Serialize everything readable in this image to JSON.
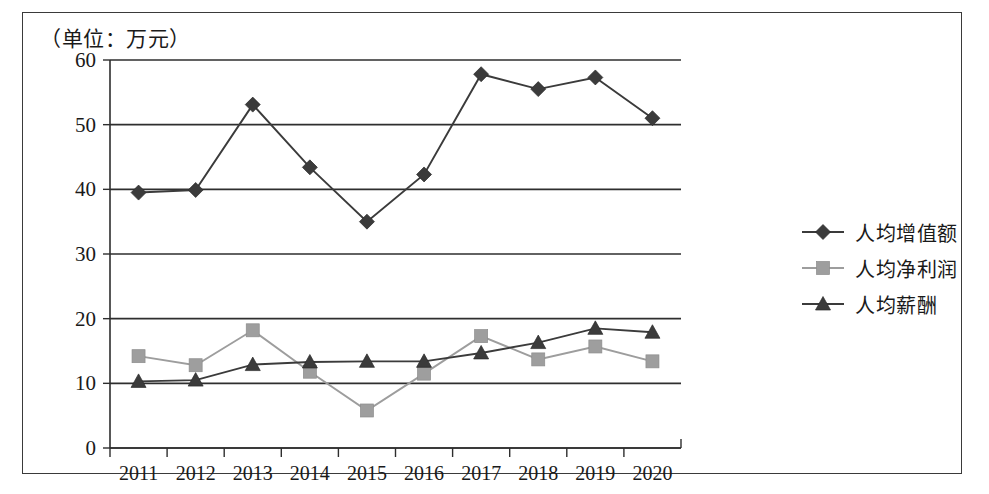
{
  "chart_data": {
    "type": "line",
    "title": "（单位：万元）",
    "xlabel": "",
    "ylabel": "",
    "ylim": [
      0,
      60
    ],
    "ytick_step": 10,
    "yticks": [
      "0",
      "10",
      "20",
      "30",
      "40",
      "50",
      "60"
    ],
    "categories": [
      "2011",
      "2012",
      "2013",
      "2014",
      "2015",
      "2016",
      "2017",
      "2018",
      "2019",
      "2020"
    ],
    "grid": true,
    "legend_position": "right",
    "series": [
      {
        "name": "人均增值额",
        "marker": "diamond",
        "color": "#3b3b3b",
        "values": [
          39.5,
          39.9,
          53.1,
          43.4,
          35.0,
          42.3,
          57.8,
          55.5,
          57.3,
          51.0
        ]
      },
      {
        "name": "人均净利润",
        "marker": "square",
        "color": "#9e9e9e",
        "values": [
          14.2,
          12.8,
          18.2,
          11.8,
          5.8,
          11.5,
          17.3,
          13.7,
          15.7,
          13.4
        ]
      },
      {
        "name": "人均薪酬",
        "marker": "triangle",
        "color": "#3b3b3b",
        "values": [
          10.3,
          10.5,
          12.9,
          13.3,
          13.4,
          13.4,
          14.7,
          16.3,
          18.5,
          17.9
        ]
      }
    ]
  },
  "legend": {
    "items": [
      {
        "label": "人均增值额",
        "marker": "diamond",
        "color": "#3b3b3b"
      },
      {
        "label": "人均净利润",
        "marker": "square",
        "color": "#9e9e9e"
      },
      {
        "label": "人均薪酬",
        "marker": "triangle",
        "color": "#3b3b3b"
      }
    ]
  }
}
